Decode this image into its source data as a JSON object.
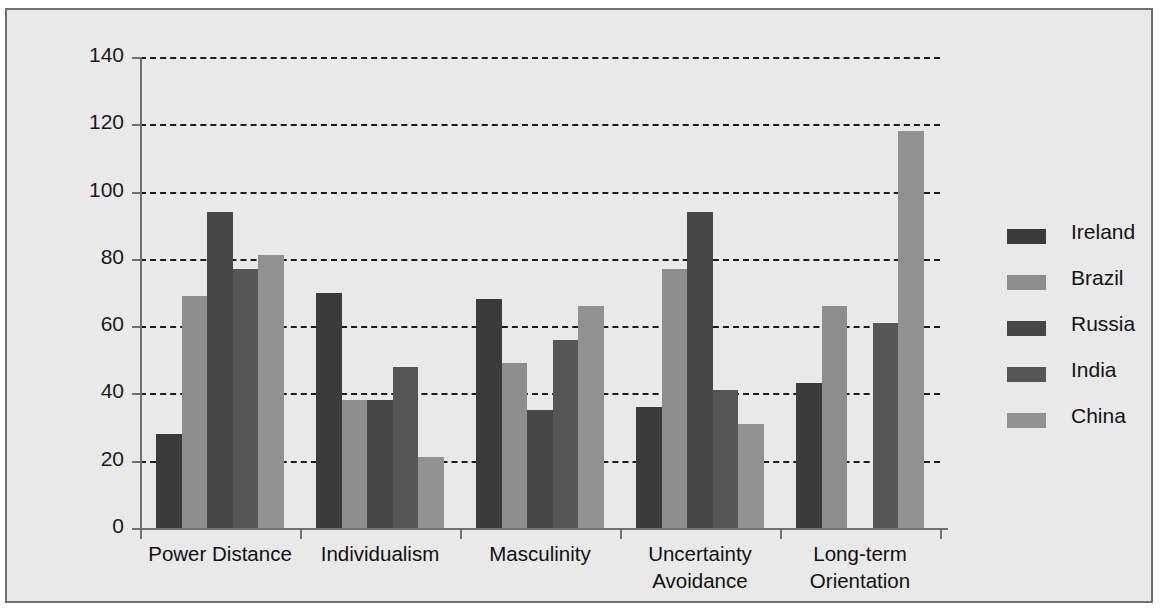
{
  "chart_data": {
    "type": "bar",
    "title": "",
    "subtitle": "",
    "xlabel": "",
    "ylabel": "",
    "categories": [
      "Power Distance",
      "Individualism",
      "Masculinity",
      "Uncertainty\nAvoidance",
      "Long-term\nOrientation"
    ],
    "series": [
      {
        "name": "Ireland",
        "color": "#3b3b3b",
        "values": [
          28,
          70,
          68,
          36,
          43
        ]
      },
      {
        "name": "Brazil",
        "color": "#8d8d8d",
        "values": [
          69,
          38,
          49,
          77,
          66
        ]
      },
      {
        "name": "Russia",
        "color": "#474747",
        "values": [
          94,
          38,
          35,
          94,
          0
        ]
      },
      {
        "name": "India",
        "color": "#565656",
        "values": [
          77,
          48,
          56,
          41,
          61
        ]
      },
      {
        "name": "China",
        "color": "#919191",
        "values": [
          81,
          21,
          66,
          31,
          118
        ]
      }
    ],
    "ylim": [
      0,
      140
    ],
    "yticks": [
      0,
      20,
      40,
      60,
      80,
      100,
      120,
      140
    ],
    "ytick_labels": [
      "0",
      "20",
      "40",
      "60",
      "80",
      "100",
      "120",
      "140"
    ],
    "grid": true,
    "grid_style": "dashed",
    "grid_axis": "y",
    "legend_position": "right",
    "background_color": "#e9e9e9",
    "frame_color": "#6f6f6f",
    "axis_color": "#707070",
    "gridline_color": "#1d1d1d"
  },
  "legend": {
    "entries": [
      {
        "label": "Ireland"
      },
      {
        "label": "Brazil"
      },
      {
        "label": "Russia"
      },
      {
        "label": "India"
      },
      {
        "label": "China"
      }
    ]
  }
}
